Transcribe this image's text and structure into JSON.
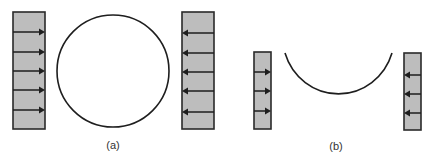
{
  "figure": {
    "panels": [
      {
        "id": "a",
        "label": "(a)",
        "shape": "full-circle",
        "left_plate": {
          "arrows": 5,
          "direction": "right"
        },
        "right_plate": {
          "arrows": 5,
          "direction": "left"
        }
      },
      {
        "id": "b",
        "label": "(b)",
        "shape": "open-arc",
        "left_plate": {
          "arrows": 3,
          "direction": "right"
        },
        "right_plate": {
          "arrows": 3,
          "direction": "left"
        }
      }
    ],
    "colors": {
      "plate_fill": "#bdbdbd",
      "stroke": "#1e1e1e",
      "background": "#ffffff"
    }
  }
}
